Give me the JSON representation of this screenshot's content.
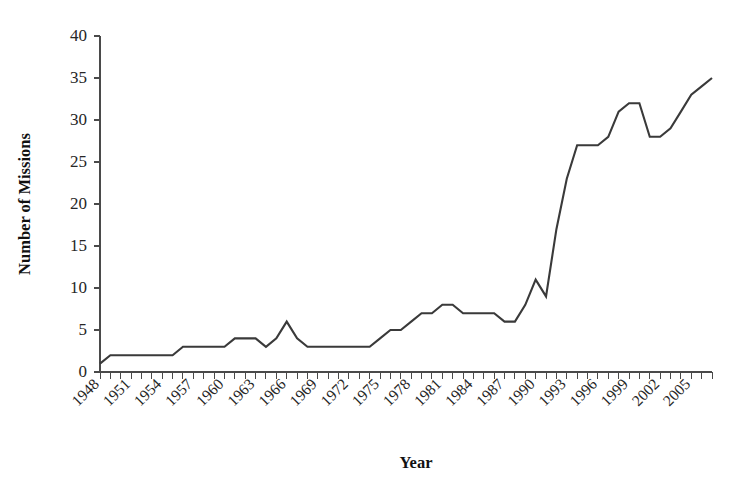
{
  "chart_data": {
    "type": "line",
    "title": "",
    "subtitle": "",
    "xlabel": "Year",
    "ylabel": "Number of Missions",
    "xlim": [
      1948,
      2007
    ],
    "ylim": [
      0,
      40
    ],
    "grid": false,
    "legend": false,
    "legend_position": "none",
    "y_ticks": [
      0,
      5,
      10,
      15,
      20,
      25,
      30,
      35,
      40
    ],
    "y_tick_labels": [
      "0",
      "5",
      "10",
      "15",
      "20",
      "25",
      "30",
      "35",
      "40"
    ],
    "x_tick_labels": [
      "1948",
      "1951",
      "1954",
      "1957",
      "1960",
      "1963",
      "1966",
      "1969",
      "1972",
      "1975",
      "1978",
      "1981",
      "1984",
      "1987",
      "1990",
      "1993",
      "1996",
      "1999",
      "2002",
      "2005"
    ],
    "x_tick_label_step": 3,
    "x_tick_label_rotation": 45,
    "x_minor_tick_step": 1,
    "line_color": "#3a3a3a",
    "axis_color": "#4a4a4a",
    "background_color": "#ffffff",
    "x": [
      1948,
      1949,
      1950,
      1951,
      1952,
      1953,
      1954,
      1955,
      1956,
      1957,
      1958,
      1959,
      1960,
      1961,
      1962,
      1963,
      1964,
      1965,
      1966,
      1967,
      1968,
      1969,
      1970,
      1971,
      1972,
      1973,
      1974,
      1975,
      1976,
      1977,
      1978,
      1979,
      1980,
      1981,
      1982,
      1983,
      1984,
      1985,
      1986,
      1987,
      1988,
      1989,
      1990,
      1991,
      1992,
      1993,
      1994,
      1995,
      1996,
      1997,
      1998,
      1999,
      2000,
      2001,
      2002,
      2003,
      2004,
      2005,
      2006,
      2007
    ],
    "values": [
      1,
      2,
      2,
      2,
      2,
      2,
      2,
      2,
      3,
      3,
      3,
      3,
      3,
      4,
      4,
      4,
      3,
      4,
      6,
      4,
      3,
      3,
      3,
      3,
      3,
      3,
      3,
      4,
      5,
      5,
      6,
      7,
      7,
      8,
      8,
      7,
      7,
      7,
      7,
      6,
      6,
      8,
      11,
      9,
      17,
      23,
      27,
      27,
      27,
      28,
      31,
      32,
      32,
      28,
      28,
      29,
      31,
      33,
      34,
      35
    ],
    "series": [
      {
        "name": "Number of Missions",
        "values": [
          1,
          2,
          2,
          2,
          2,
          2,
          2,
          2,
          3,
          3,
          3,
          3,
          3,
          4,
          4,
          4,
          3,
          4,
          6,
          4,
          3,
          3,
          3,
          3,
          3,
          3,
          3,
          4,
          5,
          5,
          6,
          7,
          7,
          8,
          8,
          7,
          7,
          7,
          7,
          6,
          6,
          8,
          11,
          9,
          17,
          23,
          27,
          27,
          27,
          28,
          31,
          32,
          32,
          28,
          28,
          29,
          31,
          33,
          34,
          35
        ]
      }
    ],
    "annotations": []
  }
}
